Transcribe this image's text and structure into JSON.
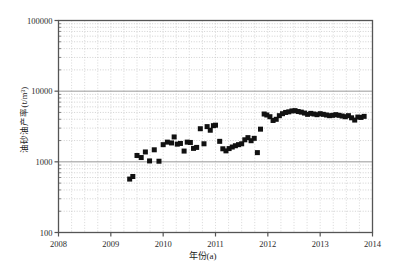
{
  "figure": {
    "background_color": "#ffffff",
    "frame_color": "#555555",
    "marker_color": "#111111",
    "gridline_color": "#bdbdbd",
    "major_gridline_color": "#8c8c8c"
  },
  "chart_data": {
    "type": "scatter",
    "title": "",
    "xlabel": "年份(a)",
    "ylabel": "油砂油产率(t/m³)",
    "yscale": "log",
    "xscale": "linear",
    "xlim": [
      2008,
      2014
    ],
    "ylim": [
      100,
      100000
    ],
    "xticks": [
      2008,
      2009,
      2010,
      2011,
      2012,
      2013,
      2014
    ],
    "xticklabels": [
      "2008",
      "2009",
      "2010",
      "2011",
      "2012",
      "2013",
      "2014"
    ],
    "yticks": [
      100,
      1000,
      10000,
      100000
    ],
    "yticklabels": [
      "100",
      "1000",
      "10000",
      "100000"
    ],
    "grid": "minor-dotted-horizontal-and-vertical",
    "legend": "none",
    "marker": "square",
    "marker_size": 5,
    "series": [
      {
        "name": "油砂油产率",
        "x": [
          2009.36,
          2009.42,
          2009.5,
          2009.58,
          2009.66,
          2009.74,
          2009.83,
          2009.92,
          2010.0,
          2010.08,
          2010.16,
          2010.21,
          2010.27,
          2010.33,
          2010.4,
          2010.46,
          2010.52,
          2010.58,
          2010.64,
          2010.71,
          2010.78,
          2010.84,
          2010.9,
          2010.96,
          2011.0,
          2011.08,
          2011.14,
          2011.2,
          2011.26,
          2011.32,
          2011.38,
          2011.44,
          2011.5,
          2011.56,
          2011.62,
          2011.68,
          2011.74,
          2011.8,
          2011.86,
          2011.93,
          2011.98,
          2012.04,
          2012.1,
          2012.16,
          2012.22,
          2012.28,
          2012.34,
          2012.4,
          2012.46,
          2012.52,
          2012.58,
          2012.64,
          2012.7,
          2012.76,
          2012.82,
          2012.88,
          2012.94,
          2013.0,
          2013.06,
          2013.12,
          2013.18,
          2013.24,
          2013.3,
          2013.36,
          2013.42,
          2013.48,
          2013.54,
          2013.6,
          2013.66,
          2013.72,
          2013.78,
          2013.84
        ],
        "y": [
          570,
          620,
          1230,
          1150,
          1380,
          1030,
          1480,
          1020,
          1750,
          1900,
          1850,
          2250,
          1780,
          1820,
          1420,
          1900,
          1880,
          1550,
          1600,
          2940,
          1800,
          3150,
          2800,
          3250,
          3300,
          1950,
          1530,
          1430,
          1540,
          1620,
          1690,
          1750,
          1800,
          2050,
          2200,
          1990,
          2150,
          1350,
          2900,
          4750,
          4600,
          4350,
          3850,
          4000,
          4500,
          4800,
          5000,
          5100,
          5250,
          5300,
          5150,
          5050,
          4900,
          4700,
          4850,
          4750,
          4650,
          4800,
          4700,
          4600,
          4500,
          4550,
          4650,
          4550,
          4450,
          4350,
          4500,
          4200,
          3900,
          4300,
          4250,
          4400
        ]
      }
    ]
  }
}
